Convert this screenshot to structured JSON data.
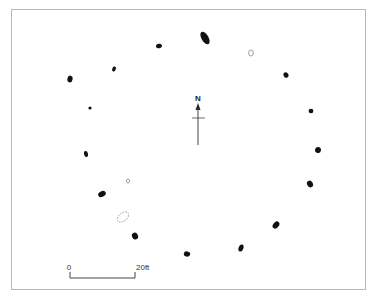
{
  "figure": {
    "type": "stone circle site plan",
    "north_label": "N",
    "scale": {
      "start_label": "0",
      "end_label": "20ft"
    }
  },
  "colors": {
    "stone": "#111111",
    "outline": "#888888",
    "frame": "#b8b8b8",
    "line": "#444444"
  },
  "stones": [
    {
      "x": 205,
      "y": 38,
      "rx": 3.5,
      "ry": 7,
      "rot": -30
    },
    {
      "x": 159,
      "y": 46,
      "rx": 3,
      "ry": 2.2,
      "rot": -15
    },
    {
      "x": 114,
      "y": 69,
      "rx": 1.8,
      "ry": 2.6,
      "rot": 20
    },
    {
      "x": 70,
      "y": 79,
      "rx": 2.6,
      "ry": 3.4,
      "rot": 10
    },
    {
      "x": 90,
      "y": 108,
      "rx": 1.6,
      "ry": 1.6,
      "rot": 0
    },
    {
      "x": 86,
      "y": 154,
      "rx": 2,
      "ry": 3,
      "rot": -10
    },
    {
      "x": 102,
      "y": 194,
      "rx": 4,
      "ry": 2.8,
      "rot": -25
    },
    {
      "x": 135,
      "y": 236,
      "rx": 3,
      "ry": 3.5,
      "rot": -20
    },
    {
      "x": 187,
      "y": 254,
      "rx": 3.2,
      "ry": 2.6,
      "rot": 10
    },
    {
      "x": 241,
      "y": 248,
      "rx": 2.4,
      "ry": 3.6,
      "rot": 20
    },
    {
      "x": 276,
      "y": 225,
      "rx": 2.8,
      "ry": 4,
      "rot": 40
    },
    {
      "x": 310,
      "y": 184,
      "rx": 2.8,
      "ry": 3.6,
      "rot": -30
    },
    {
      "x": 318,
      "y": 150,
      "rx": 3,
      "ry": 3,
      "rot": 10
    },
    {
      "x": 311,
      "y": 111,
      "rx": 2.4,
      "ry": 2.2,
      "rot": 0
    },
    {
      "x": 286,
      "y": 75,
      "rx": 2.4,
      "ry": 2.8,
      "rot": -30
    }
  ],
  "outlines": [
    {
      "x": 251,
      "y": 53,
      "rx": 2.4,
      "ry": 3,
      "rot": 0,
      "dashed": false
    },
    {
      "x": 128,
      "y": 181,
      "rx": 1.6,
      "ry": 1.8,
      "rot": 0,
      "dashed": false
    },
    {
      "x": 123,
      "y": 217,
      "rx": 6.5,
      "ry": 4,
      "rot": -40,
      "dashed": true
    }
  ]
}
